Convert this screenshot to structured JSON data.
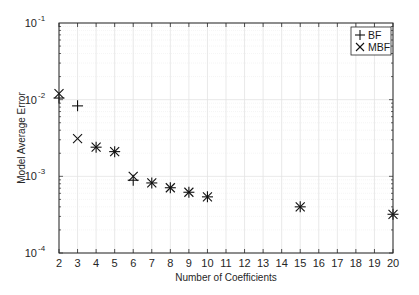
{
  "chart_data": {
    "type": "scatter",
    "title": "",
    "xlabel": "Number of Coefficients",
    "ylabel": "Model Average Error",
    "xlim": [
      2,
      20
    ],
    "ylim": [
      0.0001,
      0.1
    ],
    "yscale": "log",
    "grid": true,
    "minor_grid": true,
    "legend_position": "upper right",
    "x_ticks": [
      2,
      3,
      4,
      5,
      6,
      7,
      8,
      9,
      10,
      11,
      12,
      13,
      14,
      15,
      16,
      17,
      18,
      19,
      20
    ],
    "y_ticks": [
      {
        "value": 0.0001,
        "base": "10",
        "exp": "-4"
      },
      {
        "value": 0.001,
        "base": "10",
        "exp": "-3"
      },
      {
        "value": 0.01,
        "base": "10",
        "exp": "-2"
      },
      {
        "value": 0.1,
        "base": "10",
        "exp": "-1"
      }
    ],
    "series": [
      {
        "name": "BF",
        "marker": "+",
        "x": [
          2,
          3,
          4,
          5,
          6,
          7,
          8,
          9,
          10,
          15,
          20
        ],
        "values": [
          0.0105,
          0.0083,
          0.0024,
          0.0021,
          0.00089,
          0.00082,
          0.00071,
          0.00062,
          0.00054,
          0.0004,
          0.00032
        ]
      },
      {
        "name": "MBF",
        "marker": "x",
        "x": [
          2,
          3,
          4,
          5,
          6,
          7,
          8,
          9,
          10,
          15,
          20
        ],
        "values": [
          0.012,
          0.0031,
          0.0024,
          0.0021,
          0.001,
          0.00082,
          0.00071,
          0.00062,
          0.00054,
          0.0004,
          0.00032
        ]
      }
    ]
  },
  "legend": {
    "items": [
      {
        "label": "BF",
        "marker": "plus-icon"
      },
      {
        "label": "MBF",
        "marker": "cross-icon"
      }
    ]
  },
  "colors": {
    "axis": "#262626",
    "grid": "#e3e3e3",
    "minor_grid": "#efefef",
    "marker": "#111111"
  }
}
